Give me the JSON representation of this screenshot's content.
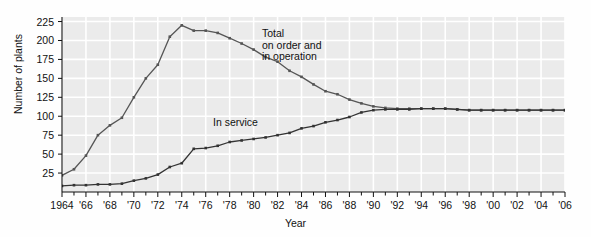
{
  "chart_data": {
    "type": "line",
    "title": "",
    "xlabel": "Year",
    "ylabel": "Number of plants",
    "xlim": [
      1964,
      2006
    ],
    "ylim": [
      0,
      231
    ],
    "grid": true,
    "legend_position": "inline-annotations",
    "yticks": [
      25,
      50,
      75,
      100,
      125,
      150,
      175,
      200,
      225
    ],
    "ytick_labels": [
      "25",
      "50",
      "75",
      "100",
      "125",
      "150",
      "175",
      "200",
      "225"
    ],
    "xticks": [
      1964,
      1966,
      1968,
      1970,
      1972,
      1974,
      1976,
      1978,
      1980,
      1982,
      1984,
      1986,
      1988,
      1990,
      1992,
      1994,
      1996,
      1998,
      2000,
      2002,
      2004,
      2006
    ],
    "xtick_labels": [
      "1964",
      "'66",
      "'68",
      "'70",
      "'72",
      "'74",
      "'76",
      "'78",
      "'80",
      "'82",
      "'84",
      "'86",
      "'88",
      "'90",
      "'92",
      "'94",
      "'96",
      "'98",
      "'00",
      "'02",
      "'04",
      "'06"
    ],
    "x": [
      1964,
      1965,
      1966,
      1967,
      1968,
      1969,
      1970,
      1971,
      1972,
      1973,
      1974,
      1975,
      1976,
      1977,
      1978,
      1979,
      1980,
      1981,
      1982,
      1983,
      1984,
      1985,
      1986,
      1987,
      1988,
      1989,
      1990,
      1991,
      1992,
      1993,
      1994,
      1995,
      1996,
      1997,
      1998,
      1999,
      2000,
      2001,
      2002,
      2003,
      2004,
      2005,
      2006
    ],
    "series": [
      {
        "name": "Total on order and in operation",
        "annotation": "Total\non order and\nin operation",
        "color": "#555555",
        "values": [
          22,
          30,
          48,
          75,
          88,
          98,
          125,
          150,
          168,
          205,
          220,
          213,
          213,
          210,
          203,
          196,
          188,
          178,
          172,
          160,
          152,
          142,
          133,
          129,
          122,
          117,
          113,
          111,
          110,
          110,
          110,
          110,
          110,
          109,
          108,
          108,
          108,
          108,
          108,
          108,
          108,
          108,
          108
        ]
      },
      {
        "name": "In service",
        "annotation": "In service",
        "color": "#333333",
        "values": [
          8,
          9,
          9,
          10,
          10,
          11,
          15,
          18,
          23,
          33,
          38,
          57,
          58,
          61,
          66,
          68,
          70,
          72,
          75,
          78,
          84,
          87,
          92,
          95,
          99,
          105,
          108,
          109,
          109,
          109,
          110,
          110,
          110,
          109,
          108,
          108,
          108,
          108,
          108,
          108,
          108,
          108,
          108
        ]
      }
    ]
  }
}
